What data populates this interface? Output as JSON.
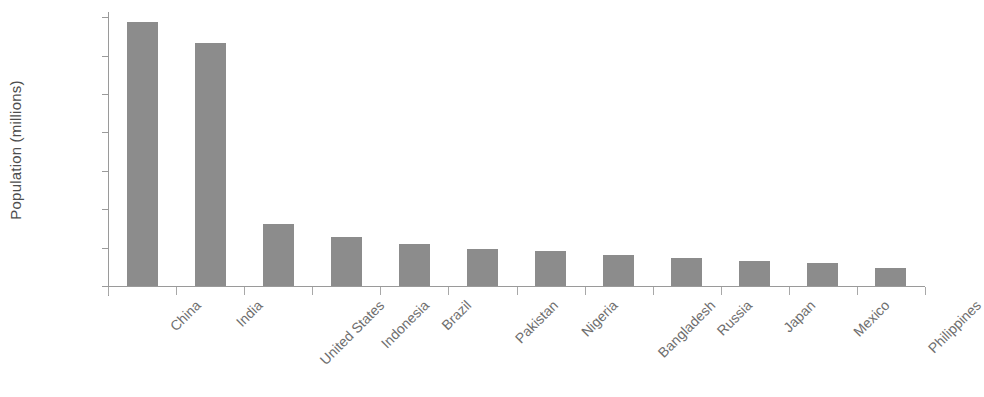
{
  "chart_data": {
    "type": "bar",
    "title": "",
    "subtitle": "",
    "xlabel": "",
    "ylabel": "Population (millions)",
    "categories": [
      "China",
      "India",
      "United States",
      "Indonesia",
      "Brazil",
      "Pakistan",
      "Nigeria",
      "Bangladesh",
      "Russia",
      "Japan",
      "Mexico",
      "Philippines"
    ],
    "values": [
      1373,
      1264,
      322,
      257,
      217,
      194,
      184,
      160,
      144,
      130,
      121,
      95
    ],
    "ylim": [
      0,
      1400
    ],
    "yticks": [
      0,
      200,
      400,
      600,
      800,
      1000,
      1200,
      1400
    ],
    "ytick_labels": [
      "0",
      "200",
      "400",
      "600",
      "800",
      "1000",
      "1200",
      "1400"
    ],
    "grid": false,
    "legend": false,
    "legend_position": "none",
    "bar_color": "#8c8c8c",
    "axis_color": "#9a9a9a",
    "tick_label_color": "#575757",
    "xlabel_rotation": -45,
    "background_color": "#ffffff"
  }
}
